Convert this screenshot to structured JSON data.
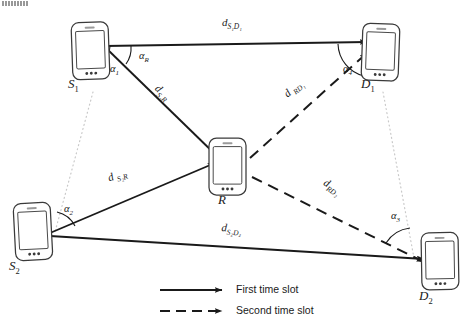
{
  "figure": {
    "type": "network-diagram",
    "corner_artifact": "scan-artifact"
  },
  "nodes": [
    {
      "id": "S1",
      "label": "S",
      "sub": "1",
      "name": "source-1",
      "x": 90,
      "y": 52,
      "label_x": 68,
      "label_y": 84
    },
    {
      "id": "S2",
      "label": "S",
      "sub": "2",
      "name": "source-2",
      "x": 31,
      "y": 233,
      "label_x": 9,
      "label_y": 265
    },
    {
      "id": "R",
      "label": "R",
      "sub": "",
      "name": "relay",
      "x": 227,
      "y": 167,
      "label_x": 215,
      "label_y": 199
    },
    {
      "id": "D1",
      "label": "D",
      "sub": "1",
      "name": "destination-1",
      "x": 381,
      "y": 52,
      "label_x": 361,
      "label_y": 84
    },
    {
      "id": "D2",
      "label": "D",
      "sub": "2",
      "name": "destination-2",
      "x": 439,
      "y": 262,
      "label_x": 419,
      "label_y": 295
    }
  ],
  "links": [
    {
      "id": "S1D1",
      "slot": "first",
      "style": "solid",
      "from": "S1",
      "to": "D1",
      "label": "d",
      "sub": "S₁D₁",
      "label_x": 222,
      "label_y": 22,
      "rotate": 0,
      "name": "link-s1-d1"
    },
    {
      "id": "S1R",
      "slot": "first",
      "style": "solid",
      "from": "S1",
      "to": "R",
      "label": "d",
      "sub": "S₁R",
      "label_x": 161,
      "label_y": 88,
      "rotate": 43,
      "name": "link-s1-r"
    },
    {
      "id": "S2R",
      "slot": "first",
      "style": "solid",
      "from": "S2",
      "to": "R",
      "label": "d",
      "sub": "S₂R",
      "label_x": 106,
      "label_y": 178,
      "rotate": -19,
      "name": "link-s2-r"
    },
    {
      "id": "S2D2",
      "slot": "first",
      "style": "solid",
      "from": "S2",
      "to": "D2",
      "label": "d",
      "sub": "S₂D₂",
      "label_x": 222,
      "label_y": 227,
      "rotate": 5,
      "name": "link-s2-d2"
    },
    {
      "id": "RD1",
      "slot": "second",
      "style": "dashed",
      "from": "R",
      "to": "D1",
      "label": "d",
      "sub": "RD₁",
      "label_x": 281,
      "label_y": 96,
      "rotate": -40,
      "name": "link-r-d1"
    },
    {
      "id": "RD2",
      "slot": "second",
      "style": "dashed",
      "from": "R",
      "to": "D2",
      "label": "d",
      "sub": "RD₂",
      "label_x": 328,
      "label_y": 182,
      "rotate": 32,
      "name": "link-r-d2"
    }
  ],
  "angles": [
    {
      "id": "a1",
      "label": "α",
      "sub": "1",
      "name": "angle-alpha-1",
      "label_x": 110,
      "label_y": 69
    },
    {
      "id": "aR",
      "label": "α",
      "sub": "R",
      "name": "angle-alpha-r",
      "label_x": 140,
      "label_y": 56
    },
    {
      "id": "a2",
      "label": "α",
      "sub": "2",
      "name": "angle-alpha-2",
      "label_x": 65,
      "label_y": 209
    },
    {
      "id": "a3",
      "label": "α",
      "sub": "3",
      "name": "angle-alpha-3",
      "label_x": 392,
      "label_y": 216
    },
    {
      "id": "a4",
      "label": "α",
      "sub": "4",
      "name": "angle-alpha-4",
      "label_x": 344,
      "label_y": 69
    }
  ],
  "reference_lines": [
    {
      "id": "ref-s1-s2",
      "from": "S1",
      "to": "S2",
      "name": "reference-line-sources"
    },
    {
      "id": "ref-d1-d2",
      "from": "D1",
      "to": "D2",
      "name": "reference-line-destinations"
    }
  ],
  "legend": {
    "items": [
      {
        "id": "first",
        "label": "First time slot",
        "style": "solid",
        "name": "legend-first-time-slot"
      },
      {
        "id": "second",
        "label": "Second time slot",
        "style": "dashed",
        "name": "legend-second-time-slot"
      }
    ]
  },
  "colors": {
    "stroke": "#1a1a1a",
    "device_stroke": "#3a3a3a",
    "reference": "#c9c9c9",
    "background": "#ffffff"
  }
}
